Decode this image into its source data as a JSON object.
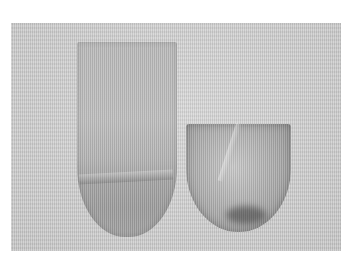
{
  "image": {
    "description": "Grayscale photograph of two fabric pocket pieces laid on a textured white cloth",
    "objects": [
      {
        "name": "tall-pocket",
        "shape": "elongated U",
        "tone": "gray ribbed fabric"
      },
      {
        "name": "short-pocket",
        "shape": "rounded shield",
        "tone": "gray ribbed fabric with folds"
      }
    ],
    "colors": {
      "background": "#ffffff",
      "cloth": "#cfcfcf",
      "pocket_light": "#bdbdbd",
      "pocket_dark": "#8a8a8a"
    }
  }
}
